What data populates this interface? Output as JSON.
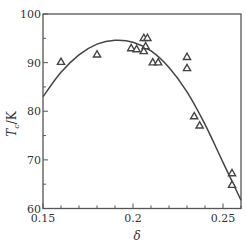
{
  "chart_data": {
    "type": "scatter",
    "title": "",
    "xlabel": "δ",
    "ylabel": "Tc/K",
    "ylabel_main": "T",
    "ylabel_sub": "c",
    "ylabel_unit": "/K",
    "xlim": [
      0.15,
      0.26
    ],
    "ylim": [
      60,
      100
    ],
    "xticks": [
      0.15,
      0.2,
      0.25
    ],
    "xtick_labels": [
      "0.15",
      "0.2",
      "0.25"
    ],
    "xminor_step": 0.01,
    "yticks": [
      60,
      70,
      80,
      90,
      100
    ],
    "ytick_labels": [
      "60",
      "70",
      "80",
      "90",
      "100"
    ],
    "yminor_step": 5,
    "grid": false,
    "legend": null,
    "series": [
      {
        "name": "measured",
        "marker": "triangle-open",
        "points": [
          [
            0.16,
            90.2
          ],
          [
            0.18,
            91.7
          ],
          [
            0.199,
            93.0
          ],
          [
            0.202,
            92.8
          ],
          [
            0.206,
            95.1
          ],
          [
            0.208,
            95.1
          ],
          [
            0.207,
            93.4
          ],
          [
            0.206,
            92.4
          ],
          [
            0.211,
            90.1
          ],
          [
            0.214,
            90.1
          ],
          [
            0.23,
            91.2
          ],
          [
            0.23,
            88.9
          ],
          [
            0.234,
            79.0
          ],
          [
            0.237,
            77.1
          ],
          [
            0.255,
            67.3
          ],
          [
            0.255,
            64.9
          ]
        ]
      },
      {
        "name": "fit",
        "type": "line",
        "points": [
          [
            0.15,
            83.0
          ],
          [
            0.16,
            88.0
          ],
          [
            0.17,
            91.6
          ],
          [
            0.18,
            93.8
          ],
          [
            0.19,
            94.6
          ],
          [
            0.2,
            94.2
          ],
          [
            0.21,
            92.4
          ],
          [
            0.22,
            89.0
          ],
          [
            0.23,
            84.0
          ],
          [
            0.24,
            77.3
          ],
          [
            0.25,
            69.5
          ],
          [
            0.26,
            61.7
          ]
        ]
      }
    ]
  },
  "colors": {
    "axis": "#555555",
    "marker": "#444444",
    "line": "#444444"
  }
}
